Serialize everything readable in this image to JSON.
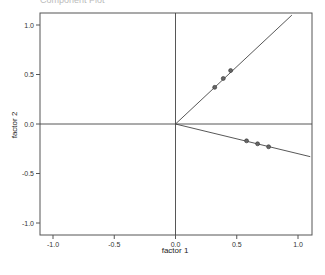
{
  "chart_data": {
    "type": "scatter",
    "title": "Component Plot",
    "xlabel": "factor 1",
    "ylabel": "factor 2",
    "xlim": [
      -1.1,
      1.1
    ],
    "ylim": [
      -1.1,
      1.1
    ],
    "xticks": [
      -1.0,
      -0.5,
      0.0,
      0.5,
      1.0
    ],
    "yticks": [
      -1.0,
      -0.5,
      0.0,
      0.5,
      1.0
    ],
    "xtick_labels": [
      "-1.0",
      "-0.5",
      "0.0",
      "0.5",
      "1.0"
    ],
    "ytick_labels": [
      "-1.0",
      "-0.5",
      "0.0",
      "0.5",
      "1.0"
    ],
    "grid": false,
    "reference_lines": {
      "x": 0.0,
      "y": 0.0
    },
    "series": [
      {
        "name": "group 1",
        "points": [
          {
            "x": 0.32,
            "y": 0.37
          },
          {
            "x": 0.39,
            "y": 0.46
          },
          {
            "x": 0.45,
            "y": 0.54
          }
        ],
        "ray_end": {
          "x": 0.95,
          "y": 1.1
        }
      },
      {
        "name": "group 2",
        "points": [
          {
            "x": 0.58,
            "y": -0.17
          },
          {
            "x": 0.67,
            "y": -0.2
          },
          {
            "x": 0.76,
            "y": -0.23
          }
        ],
        "ray_end": {
          "x": 1.1,
          "y": -0.33
        }
      }
    ],
    "colors": {
      "frame": "#555555",
      "line": "#444444",
      "point_fill": "#666666",
      "point_stroke": "#333333"
    }
  }
}
